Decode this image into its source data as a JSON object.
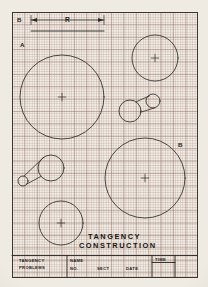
{
  "sheet": {
    "title_line1": "TANGENCY",
    "title_line2": "CONSTRUCTION",
    "label_a": "A",
    "label_b_top": "B",
    "label_b_right": "B",
    "dimension_label": "R",
    "paper_color": "#f3efe7",
    "ink_color": "#2e2a26",
    "grid_color": "#a8917f"
  },
  "title_block": {
    "problem_line1": "TANGENCY",
    "problem_line2": "PROBLEMS",
    "name_label": "NAME",
    "no_label": "NO.",
    "sect_label": "SECT",
    "date_label": "DATE",
    "time_label": "TIME",
    "name_value": "",
    "no_value": "",
    "sect_value": "",
    "date_value": "",
    "time_value": ""
  },
  "drawing": {
    "type": "engineering-worksheet",
    "circles": [
      {
        "name": "circle-a-large",
        "cx": 62,
        "cy": 97,
        "r": 42,
        "center_mark": true
      },
      {
        "name": "circle-top-right",
        "cx": 155,
        "cy": 58,
        "r": 23,
        "center_mark": true
      },
      {
        "name": "circle-b-large",
        "cx": 145,
        "cy": 178,
        "r": 40,
        "center_mark": true
      },
      {
        "name": "circle-bottom-left",
        "cx": 61,
        "cy": 223,
        "r": 22,
        "center_mark": true
      },
      {
        "name": "circle-mid-pair-large",
        "cx": 130,
        "cy": 111,
        "r": 11,
        "center_mark": false
      },
      {
        "name": "circle-mid-pair-small",
        "cx": 153,
        "cy": 101,
        "r": 7,
        "center_mark": false
      },
      {
        "name": "circle-low-pair-large",
        "cx": 51,
        "cy": 168,
        "r": 13,
        "center_mark": false
      },
      {
        "name": "circle-low-pair-small",
        "cx": 23,
        "cy": 181,
        "r": 5,
        "center_mark": false
      }
    ],
    "dimension_line": {
      "x1": 31,
      "x2": 104,
      "y": 20,
      "label": "R"
    },
    "reference_line": {
      "x1": 31,
      "x2": 104,
      "y": 31
    }
  }
}
